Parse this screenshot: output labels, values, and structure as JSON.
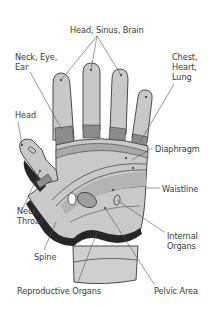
{
  "diagram": {
    "colors": {
      "background": "#ffffff",
      "finger_light": "#c8c8c8",
      "palm_light": "#c9c9c9",
      "band_mid": "#a9a9a9",
      "band_dark": "#8c8c8c",
      "outline": "#3a3a3a",
      "spine_dark": "#262626",
      "wrist": "#cfcfcf",
      "label_text": "#3a3a3a",
      "leader_line": "#555555"
    },
    "labels": {
      "head_sinus_brain": "Head, Sinus, Brain",
      "neck_eye_ear": "Neck, Eye,\nEar",
      "chest_heart_lung": "Chest,\nHeart,\nLung",
      "head": "Head",
      "diaphragm": "Diaphragm",
      "waistline": "Waistline",
      "neck_throat": "Neck,\nThroat",
      "internal_organs": "Internal\nOrgans",
      "spine": "Spine",
      "reproductive_organs": "Reproductive Organs",
      "pelvic_area": "Pelvic Area"
    }
  }
}
